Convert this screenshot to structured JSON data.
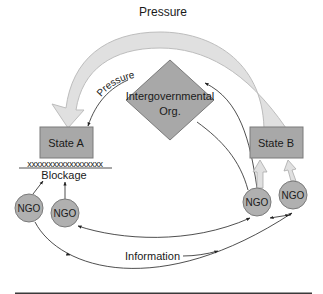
{
  "diagram": {
    "top_arrow_label": "Pressure",
    "inner_arrow_label": "Pressure",
    "igo_line1": "Intergovernmental",
    "igo_line2": "Org.",
    "state_a": "State A",
    "state_b": "State B",
    "blockage_marks": "xxxxxxxxxxxxxxxxxx",
    "blockage_label": "Blockage",
    "ngo_labels": [
      "NGO",
      "NGO",
      "NGO",
      "NGO"
    ],
    "information_label": "Information"
  },
  "colors": {
    "box_fill": "#a8a8a8",
    "box_stroke": "#7a7a7a",
    "ngo_fill": "#b0b0b0",
    "big_arrow_fill": "#e0e0e0",
    "big_arrow_stroke": "#bdbdbd",
    "line": "#222222",
    "bottom_rule": "#3a3a3a"
  }
}
